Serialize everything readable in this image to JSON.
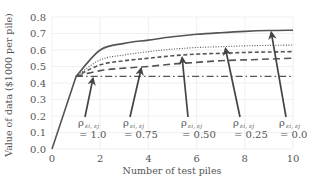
{
  "chart_data": {
    "type": "line",
    "title": "",
    "xlabel": "Number of test piles",
    "ylabel": "Value of data ($1000 per pile)",
    "xlim": [
      0,
      10
    ],
    "ylim": [
      0,
      0.8
    ],
    "xticks": [
      "0",
      "2",
      "4",
      "6",
      "8",
      "10"
    ],
    "yticks": [
      "0.0",
      "0.1",
      "0.2",
      "0.3",
      "0.4",
      "0.5",
      "0.6",
      "0.7",
      "0.8"
    ],
    "grid": true,
    "legend": "none (inline arrow annotations)",
    "x": [
      0,
      1,
      2,
      3,
      4,
      5,
      6,
      7,
      8,
      9,
      10
    ],
    "series": [
      {
        "name": "ρ_{εi,εj} = 0.0",
        "style": "solid",
        "values": [
          0,
          0.44,
          0.6,
          0.64,
          0.66,
          0.68,
          0.695,
          0.705,
          0.713,
          0.718,
          0.72
        ]
      },
      {
        "name": "ρ_{εi,εj} = 0.25",
        "style": "dotted",
        "values": [
          0,
          0.44,
          0.54,
          0.57,
          0.59,
          0.605,
          0.615,
          0.62,
          0.625,
          0.628,
          0.63
        ]
      },
      {
        "name": "ρ_{εi,εj} = 0.50",
        "style": "dashed",
        "values": [
          0,
          0.44,
          0.51,
          0.535,
          0.55,
          0.565,
          0.575,
          0.58,
          0.585,
          0.588,
          0.59
        ]
      },
      {
        "name": "ρ_{εi,εj} = 0.75",
        "style": "long-dashed",
        "values": [
          0,
          0.44,
          0.475,
          0.49,
          0.5,
          0.515,
          0.525,
          0.535,
          0.54,
          0.545,
          0.55
        ]
      },
      {
        "name": "ρ_{εi,εj} = 1.0",
        "style": "dash-dot",
        "values": [
          0,
          0.44,
          0.44,
          0.44,
          0.44,
          0.44,
          0.44,
          0.44,
          0.44,
          0.44,
          0.44
        ]
      }
    ],
    "annotations": [
      {
        "symbol": "ρ",
        "subscript": "εi, εj",
        "value_text": "= 1.0",
        "arrow_to": [
          1.7,
          0.44
        ]
      },
      {
        "symbol": "ρ",
        "subscript": "εi, εj",
        "value_text": "= 0.75",
        "arrow_to": [
          3.7,
          0.5
        ]
      },
      {
        "symbol": "ρ",
        "subscript": "εi, εj",
        "value_text": "= 0.50",
        "arrow_to": [
          5.4,
          0.565
        ]
      },
      {
        "symbol": "ρ",
        "subscript": "εi, εj",
        "value_text": "= 0.25",
        "arrow_to": [
          7.2,
          0.62
        ]
      },
      {
        "symbol": "ρ",
        "subscript": "εi, εj",
        "value_text": "= 0.0",
        "arrow_to": [
          9.1,
          0.718
        ]
      }
    ]
  }
}
